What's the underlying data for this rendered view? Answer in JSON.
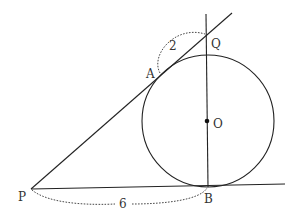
{
  "figure": {
    "points": [
      {
        "id": "P",
        "label": "P"
      },
      {
        "id": "B",
        "label": "B"
      },
      {
        "id": "A",
        "label": "A"
      },
      {
        "id": "Q",
        "label": "Q"
      },
      {
        "id": "O",
        "label": "O"
      }
    ],
    "measurements": {
      "AQ": "2",
      "PB": "6"
    }
  },
  "colors": {
    "stroke": "#222222",
    "text": "#333333",
    "background": "#ffffff"
  }
}
